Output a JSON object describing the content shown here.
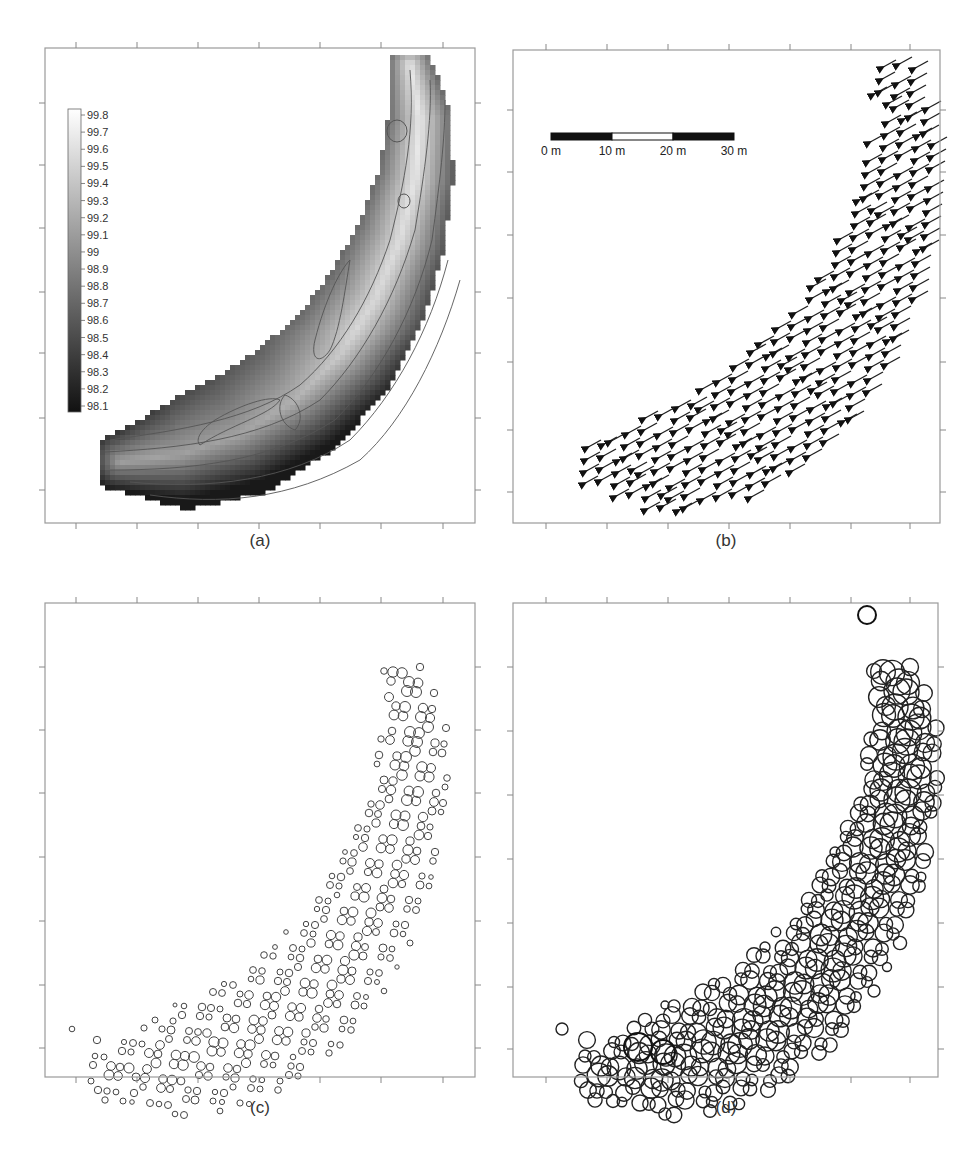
{
  "figure": {
    "panels": [
      {
        "id": "a",
        "caption": "(a)",
        "type": "contour",
        "description": "Bed elevation contour map with colorbar"
      },
      {
        "id": "b",
        "caption": "(b)",
        "type": "vector-field",
        "description": "Velocity vectors with scale bar"
      },
      {
        "id": "c",
        "caption": "(c)",
        "type": "scatter-circles",
        "description": "Proportional circles (small)"
      },
      {
        "id": "d",
        "caption": "(d)",
        "type": "scatter-circles",
        "description": "Proportional circles (large)"
      }
    ]
  },
  "colorbar": {
    "labels": [
      "99.8",
      "99.7",
      "99.6",
      "99.5",
      "99.4",
      "99.3",
      "99.2",
      "99.1",
      "99",
      "98.9",
      "98.8",
      "98.7",
      "98.6",
      "98.5",
      "98.4",
      "98.3",
      "98.2",
      "98.1"
    ],
    "min": 98.05,
    "max": 99.85,
    "color_low": "#111111",
    "color_high": "#ffffff"
  },
  "scalebar": {
    "labels": [
      "0 m",
      "10 m",
      "20 m",
      "30 m"
    ],
    "segments": [
      "black",
      "white",
      "black"
    ]
  },
  "chart_data": [
    {
      "panel": "a",
      "type": "heatmap",
      "title": "(a)",
      "xlabel": "",
      "ylabel": "",
      "legend": {
        "type": "colorbar",
        "position": "upper-left",
        "ticks": [
          99.8,
          99.7,
          99.6,
          99.5,
          99.4,
          99.3,
          99.2,
          99.1,
          99.0,
          98.9,
          98.8,
          98.7,
          98.6,
          98.5,
          98.4,
          98.3,
          98.2,
          98.1
        ]
      },
      "contour_interval": 0.1,
      "grid": false
    },
    {
      "panel": "b",
      "type": "scatter",
      "title": "(b)",
      "marker": "arrow",
      "dominant_direction": "south-west",
      "scalebar": {
        "labels": [
          "0 m",
          "10 m",
          "20 m",
          "30 m"
        ]
      },
      "grid": false
    },
    {
      "panel": "c",
      "type": "scatter",
      "title": "(c)",
      "marker": "open-circle",
      "size_range_px": [
        2,
        6
      ],
      "grid": false
    },
    {
      "panel": "d",
      "type": "scatter",
      "title": "(d)",
      "marker": "open-circle",
      "size_range_px": [
        4,
        16
      ],
      "grid": false
    }
  ]
}
